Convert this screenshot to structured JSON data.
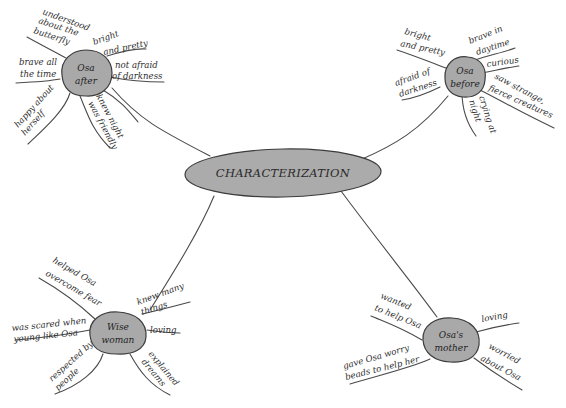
{
  "diagram": {
    "type": "mind-map",
    "center": {
      "label": "CHARACTERIZATION"
    },
    "nodes": [
      {
        "id": "osa-after",
        "label_lines": [
          "Osa",
          "after"
        ],
        "branches": [
          {
            "lines": [
              "understood",
              "about the",
              "butterfly"
            ]
          },
          {
            "lines": [
              "bright",
              "and pretty"
            ]
          },
          {
            "lines": [
              "not afraid",
              "of darkness"
            ]
          },
          {
            "lines": [
              "brave all",
              "the time"
            ]
          },
          {
            "lines": [
              "happy about",
              "herself"
            ]
          },
          {
            "lines": [
              "knew night",
              "was friendly"
            ]
          }
        ]
      },
      {
        "id": "osa-before",
        "label_lines": [
          "Osa",
          "before"
        ],
        "branches": [
          {
            "lines": [
              "bright",
              "and pretty"
            ]
          },
          {
            "lines": [
              "brave in",
              "daytime"
            ]
          },
          {
            "lines": [
              "curious"
            ]
          },
          {
            "lines": [
              "afraid of",
              "darkness"
            ]
          },
          {
            "lines": [
              "saw strange,",
              "fierce creatures"
            ]
          },
          {
            "lines": [
              "crying at",
              "night"
            ]
          }
        ]
      },
      {
        "id": "wise-woman",
        "label_lines": [
          "Wise",
          "woman"
        ],
        "branches": [
          {
            "lines": [
              "helped Osa",
              "overcome fear"
            ]
          },
          {
            "lines": [
              "knew many",
              "things"
            ]
          },
          {
            "lines": [
              "was scared when",
              "young like Osa"
            ]
          },
          {
            "lines": [
              "loving"
            ]
          },
          {
            "lines": [
              "respected by",
              "people"
            ]
          },
          {
            "lines": [
              "explained",
              "dreams"
            ]
          }
        ]
      },
      {
        "id": "osas-mother",
        "label_lines": [
          "Osa's",
          "mother"
        ],
        "branches": [
          {
            "lines": [
              "wanted",
              "to help Osa"
            ]
          },
          {
            "lines": [
              "loving"
            ]
          },
          {
            "lines": [
              "gave Osa worry",
              "beads to help her"
            ]
          },
          {
            "lines": [
              "worried",
              "about Osa"
            ]
          }
        ]
      }
    ]
  }
}
